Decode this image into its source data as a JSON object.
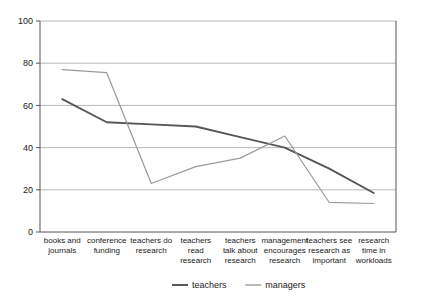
{
  "chart_data": {
    "type": "line",
    "title": "",
    "subtitle": "",
    "xlabel": "",
    "ylabel": "",
    "ylim": [
      0,
      100
    ],
    "yticks": [
      0,
      20,
      40,
      60,
      80,
      100
    ],
    "ytick_labels": [
      "0",
      "20",
      "40",
      "60",
      "80",
      "100"
    ],
    "grid": true,
    "legend_position": "bottom-center",
    "categories": [
      "books and journals",
      "conference funding",
      "teachers do research",
      "teachers read research",
      "teachers talk about research",
      "management encourages research",
      "teachers see research as important",
      "research time in workloads"
    ],
    "category_lines": [
      [
        "books and",
        "journals"
      ],
      [
        "conference",
        "funding"
      ],
      [
        "teachers do",
        "research"
      ],
      [
        "teachers",
        "read",
        "research"
      ],
      [
        "teachers",
        "talk about",
        "research"
      ],
      [
        "management",
        "encourages",
        "research"
      ],
      [
        "teachers see",
        "research as",
        "important"
      ],
      [
        "research",
        "time in",
        "workloads"
      ]
    ],
    "series": [
      {
        "name": "teachers",
        "color": "#575757",
        "values": [
          63,
          52,
          51,
          50,
          45,
          40,
          30,
          18.5
        ]
      },
      {
        "name": "managers",
        "color": "#9a9a9a",
        "values": [
          77,
          75.5,
          23,
          31,
          35,
          45.5,
          14,
          13.5
        ]
      }
    ],
    "colors": {
      "teachers": "#575757",
      "managers": "#9a9a9a",
      "gridline": "#b8b8b8",
      "axis": "#555555",
      "text": "#1a1a1a",
      "background": "#ffffff"
    }
  },
  "legend": {
    "items": [
      {
        "label": "teachers",
        "color": "#575757"
      },
      {
        "label": "managers",
        "color": "#9a9a9a"
      }
    ]
  }
}
